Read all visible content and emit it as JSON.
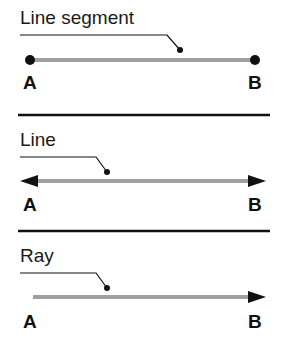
{
  "panels": [
    {
      "title": "Line segment",
      "start_point": "A",
      "end_point": "B",
      "type": "segment"
    },
    {
      "title": "Line",
      "start_point": "A",
      "end_point": "B",
      "type": "line"
    },
    {
      "title": "Ray",
      "start_point": "A",
      "end_point": "B",
      "type": "ray"
    }
  ],
  "colors": {
    "stroke_main": "#a0a0a0",
    "ink": "#111111",
    "divider": "#111111"
  }
}
